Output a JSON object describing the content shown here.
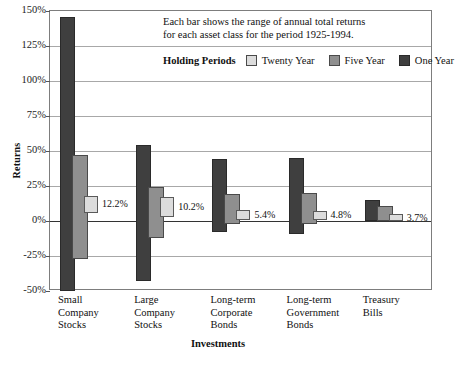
{
  "chart_data": {
    "type": "bar",
    "title": "",
    "annotation": [
      "Each bar shows the range of annual total returns",
      "for each asset class for the period 1925-1994."
    ],
    "xlabel": "Investments",
    "ylabel": "Returns",
    "ylim": [
      -50,
      150
    ],
    "ytick_labels": [
      "150%",
      "125%",
      "100%",
      "75%",
      "50%",
      "25%",
      "0%",
      "-25%",
      "-50%"
    ],
    "ytick_values": [
      150,
      125,
      100,
      75,
      50,
      25,
      0,
      -25,
      -50
    ],
    "grid": true,
    "legend_title_line1": "Holding",
    "legend_title_line2": "Periods",
    "legend_position": "top-inside",
    "legend": [
      {
        "name": "Twenty Year",
        "color": "#dcdcdc"
      },
      {
        "name": "Five Year",
        "color": "#8f8f8f"
      },
      {
        "name": "One Year",
        "color": "#3f3f3f"
      }
    ],
    "categories": [
      {
        "lines": [
          "Small",
          "Company",
          "Stocks"
        ]
      },
      {
        "lines": [
          "Large",
          "Company",
          "Stocks"
        ]
      },
      {
        "lines": [
          "Long-term",
          "Corporate",
          "Bonds"
        ]
      },
      {
        "lines": [
          "Long-term",
          "Government",
          "Bonds"
        ]
      },
      {
        "lines": [
          "Treasury",
          "Bills"
        ]
      }
    ],
    "series": [
      {
        "name": "One Year",
        "color": "#3f3f3f",
        "ranges": [
          {
            "high": 146,
            "low": -50
          },
          {
            "high": 54,
            "low": -43
          },
          {
            "high": 44,
            "low": -8
          },
          {
            "high": 45,
            "low": -9
          },
          {
            "high": 15,
            "low": 0
          }
        ]
      },
      {
        "name": "Five Year",
        "color": "#8f8f8f",
        "ranges": [
          {
            "high": 47,
            "low": -27
          },
          {
            "high": 24,
            "low": -12
          },
          {
            "high": 19,
            "low": -2
          },
          {
            "high": 20,
            "low": -2
          },
          {
            "high": 11,
            "low": 0
          }
        ]
      },
      {
        "name": "Twenty Year",
        "color": "#dcdcdc",
        "ranges": [
          {
            "high": 18,
            "low": 6
          },
          {
            "high": 17,
            "low": 3
          },
          {
            "high": 8,
            "low": 1
          },
          {
            "high": 7,
            "low": 1
          },
          {
            "high": 5,
            "low": 0
          }
        ]
      }
    ],
    "value_labels": [
      "12.2%",
      "10.2%",
      "5.4%",
      "4.8%",
      "3.7%"
    ]
  }
}
